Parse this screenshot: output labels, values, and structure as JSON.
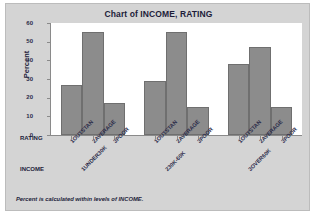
{
  "chart_data": {
    "type": "bar",
    "title": "Chart of INCOME, RATING",
    "xlabel": "",
    "ylabel": "Percent",
    "ylim": [
      0,
      60
    ],
    "yticks": [
      0,
      10,
      20,
      30,
      40,
      50,
      60
    ],
    "grid": false,
    "legend": "none",
    "footnote": "Percent is calculated within levels of INCOME.",
    "group_axis_label": "INCOME",
    "category_axis_label": "RATING",
    "categories": [
      "1OUTSTAN",
      "2AVERAGE",
      "3POOR"
    ],
    "groups": [
      {
        "name": "1UNDER30K",
        "values": [
          27,
          55,
          17
        ]
      },
      {
        "name": "230K-60K",
        "values": [
          29,
          55,
          15
        ]
      },
      {
        "name": "3OVER60K",
        "values": [
          38,
          47,
          15
        ]
      }
    ]
  },
  "colors": {
    "bar_fill": "#8c8c8c",
    "bar_edge": "#6f6f6f",
    "panel_background": "#d4d4d4",
    "plot_background": "#ffffff",
    "text": "#1d1d3a",
    "axis": "#8a8a8a"
  }
}
